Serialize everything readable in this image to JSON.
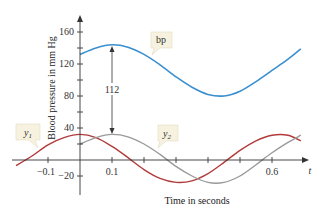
{
  "chart_data": {
    "type": "line",
    "title": "",
    "xlabel": "Time in seconds",
    "ylabel": "Blood pressure in mm Hg",
    "x_axis_symbol": "t",
    "xlim": [
      -0.2,
      0.72
    ],
    "ylim": [
      -30,
      175
    ],
    "x_ticks": [
      -0.1,
      0.1,
      0.2,
      0.3,
      0.4,
      0.5,
      0.6
    ],
    "x_tick_labels": [
      "-0.1",
      "0.1",
      "0.6"
    ],
    "y_ticks": [
      -20,
      20,
      40,
      60,
      80,
      100,
      120,
      140,
      160
    ],
    "y_tick_labels": [
      "160",
      "120",
      "80",
      "40",
      "-20"
    ],
    "grid": false,
    "annotations": [
      {
        "text": "112",
        "type": "double-arrow",
        "x": 0.1,
        "y_from": 32,
        "y_to": 144,
        "description": "vertical distance between y2 peak and bp peak"
      }
    ],
    "series": [
      {
        "name": "bp",
        "color": "#3a8fcf",
        "x": [
          0.0,
          0.05,
          0.1,
          0.15,
          0.2,
          0.25,
          0.3,
          0.35,
          0.4,
          0.45,
          0.5,
          0.55,
          0.6,
          0.65,
          0.69
        ],
        "y": [
          132,
          140,
          144,
          141,
          132,
          119,
          104,
          91,
          82,
          80,
          86,
          98,
          112,
          126,
          139
        ]
      },
      {
        "name": "y1",
        "color": "#b23a3a",
        "x": [
          -0.2,
          -0.15,
          -0.1,
          -0.05,
          0.0,
          0.05,
          0.1,
          0.15,
          0.2,
          0.25,
          0.3,
          0.35,
          0.4,
          0.45,
          0.5,
          0.55,
          0.6,
          0.65,
          0.69
        ],
        "y": [
          -7,
          5,
          19,
          28,
          32,
          28,
          17,
          3,
          -12,
          -23,
          -28,
          -26,
          -17,
          -3,
          12,
          24,
          31,
          31,
          24
        ]
      },
      {
        "name": "y2",
        "color": "#9a9a9a",
        "x": [
          0.0,
          0.05,
          0.1,
          0.15,
          0.2,
          0.25,
          0.3,
          0.35,
          0.4,
          0.45,
          0.5,
          0.55,
          0.6,
          0.65,
          0.69
        ],
        "y": [
          20,
          28,
          32,
          29,
          20,
          7,
          -8,
          -20,
          -28,
          -28,
          -20,
          -6,
          9,
          22,
          31
        ]
      }
    ],
    "legend_position": "inline callouts"
  },
  "labels": {
    "bp": "bp",
    "y1_main": "y",
    "y1_sub": "1",
    "y2_main": "y",
    "y2_sub": "2",
    "diff": "112",
    "xlabel": "Time in seconds",
    "ylabel": "Blood pressure in mm Hg",
    "t": "t",
    "tick_160": "160",
    "tick_120": "120",
    "tick_80": "80",
    "tick_40": "40",
    "tick_m20": "−20",
    "tick_m01": "−0.1",
    "tick_01": "0.1",
    "tick_06": "0.6"
  },
  "colors": {
    "bp": "#3a8fcf",
    "y1": "#b23a3a",
    "y2": "#9a9a9a",
    "axis": "#333333",
    "callout_bg": "#f6f2df",
    "callout_border": "#e3dcc0"
  }
}
